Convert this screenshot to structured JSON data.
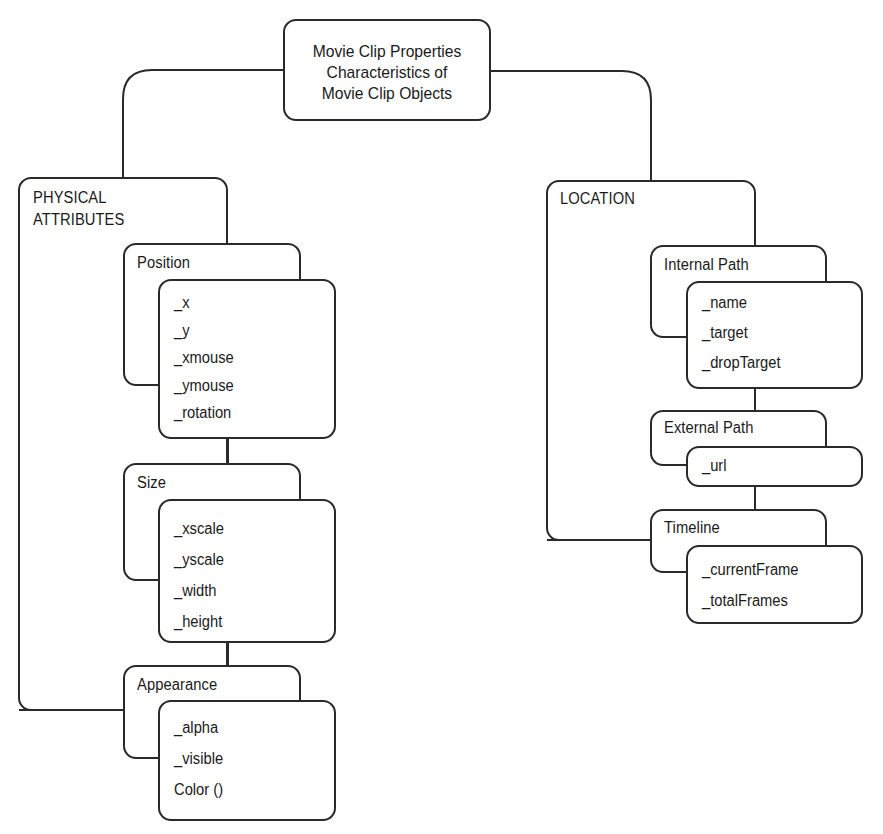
{
  "root": {
    "lines": [
      "Movie Clip Properties",
      "Characteristics of",
      "Movie Clip Objects"
    ]
  },
  "groups": [
    {
      "title_lines": [
        "PHYSICAL",
        "ATTRIBUTES"
      ],
      "categories": [
        {
          "title": "Position",
          "items": [
            "_x",
            "_y",
            "_xmouse",
            "_ymouse",
            "_rotation"
          ]
        },
        {
          "title": "Size",
          "items": [
            "_xscale",
            "_yscale",
            "_width",
            "_height"
          ]
        },
        {
          "title": "Appearance",
          "items": [
            "_alpha",
            "_visible",
            "Color ()"
          ]
        }
      ]
    },
    {
      "title_lines": [
        "LOCATION"
      ],
      "categories": [
        {
          "title": "Internal Path",
          "items": [
            "_name",
            "_target",
            "_dropTarget"
          ]
        },
        {
          "title": "External Path",
          "items": [
            "_url"
          ]
        },
        {
          "title": "Timeline",
          "items": [
            "_currentFrame",
            "_totalFrames"
          ]
        }
      ]
    }
  ],
  "colors": {
    "line": "#2a2a2a",
    "text": "#1a1a1a",
    "background": "#ffffff"
  }
}
